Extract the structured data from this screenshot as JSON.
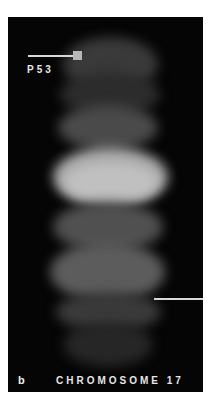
{
  "figure": {
    "panel_letter": "b",
    "title": "CHROMOSOME 17",
    "probe_label": "P53",
    "colors": {
      "background": "#050505",
      "signal": "#d8d8d8",
      "page": "#ffffff"
    }
  }
}
